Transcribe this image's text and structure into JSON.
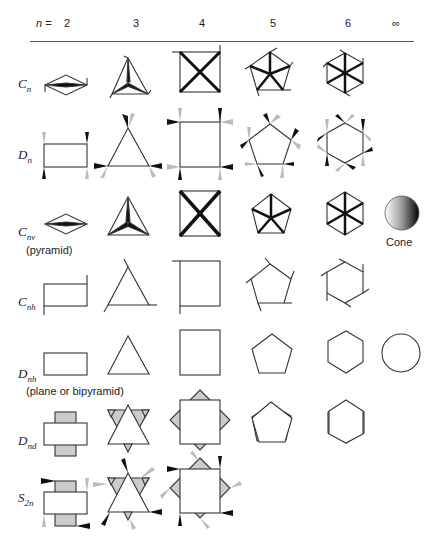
{
  "header": {
    "n_label": "n =",
    "columns": [
      "2",
      "3",
      "4",
      "5",
      "6",
      "∞"
    ]
  },
  "rows": [
    {
      "symbol": "C",
      "subscript": "n",
      "note": ""
    },
    {
      "symbol": "D",
      "subscript": "n",
      "note": ""
    },
    {
      "symbol": "C",
      "subscript": "nv",
      "note": "(pyramid)"
    },
    {
      "symbol": "C",
      "subscript": "nh",
      "note": ""
    },
    {
      "symbol": "D",
      "subscript": "nh",
      "note": "(plane or bipyramid)"
    },
    {
      "symbol": "D",
      "subscript": "nd",
      "note": ""
    },
    {
      "symbol": "S",
      "subscript": "2n",
      "note": ""
    }
  ],
  "extra_labels": {
    "cone": "Cone"
  },
  "colors": {
    "line": "#333333",
    "dark_wedge": "#111111",
    "light_wedge": "#bbbbbb",
    "fill_grey": "#cccccc"
  }
}
